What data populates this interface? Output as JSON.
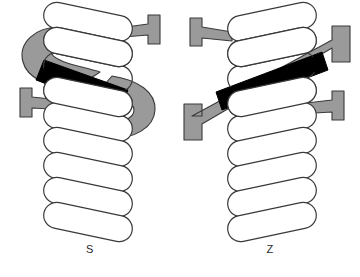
{
  "figure": {
    "background_color": "#ffffff",
    "width": 360,
    "height": 277
  },
  "colors": {
    "outline": "#3a3a3a",
    "coil_fill": "#ffffff",
    "band_gray": "#9a9a9a",
    "band_black": "#000000",
    "label_text": "#2b2b2b",
    "background": "#ffffff"
  },
  "panels": [
    {
      "id": "s",
      "label": "S",
      "twist_direction": "S",
      "band": {
        "shape": "s-curve",
        "gray_color": "#9a9a9a",
        "black_segment_color": "#000000",
        "black_segment_direction": "upper-left-to-lower-right"
      },
      "arrows": [
        {
          "name": "top-right-arrow",
          "direction": "right",
          "color": "#9a9a9a"
        },
        {
          "name": "bottom-left-arrow",
          "direction": "left",
          "color": "#9a9a9a"
        }
      ],
      "coil": {
        "turns": 9,
        "fill": "#ffffff",
        "stroke": "#3a3a3a"
      }
    },
    {
      "id": "z",
      "label": "Z",
      "twist_direction": "Z",
      "band": {
        "shape": "z-diagonal",
        "gray_color": "#9a9a9a",
        "black_segment_color": "#000000",
        "black_segment_direction": "lower-left-to-upper-right"
      },
      "arrows": [
        {
          "name": "top-left-arrow",
          "direction": "left",
          "color": "#9a9a9a"
        },
        {
          "name": "bottom-right-arrow",
          "direction": "right",
          "color": "#9a9a9a"
        }
      ],
      "coil": {
        "turns": 9,
        "fill": "#ffffff",
        "stroke": "#3a3a3a"
      }
    }
  ]
}
